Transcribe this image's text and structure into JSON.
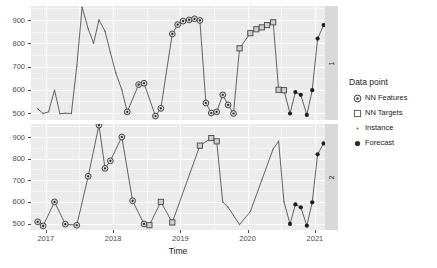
{
  "chart_data": {
    "type": "line",
    "title": "",
    "xlabel": "Time",
    "ylabel": "",
    "xlim": [
      2016.78,
      2021.15
    ],
    "ylim": [
      470,
      960
    ],
    "grid": true,
    "legend_position": "right",
    "x_ticks": [
      "2017",
      "2018",
      "2019",
      "2020",
      "2021"
    ],
    "x_tick_values": [
      2017,
      2018,
      2019,
      2020,
      2021
    ],
    "y_ticks": [
      "500",
      "600",
      "700",
      "800",
      "900"
    ],
    "y_tick_values": [
      500,
      600,
      700,
      800,
      900
    ],
    "facets": [
      {
        "strip_label": "1"
      },
      {
        "strip_label": "2"
      }
    ],
    "legend": {
      "title": "Data point",
      "items": [
        {
          "label": "NN Features",
          "marker": "circle-dot"
        },
        {
          "label": "NN Targets",
          "marker": "open-square"
        },
        {
          "label": "Instance",
          "marker": "small-dot"
        },
        {
          "label": "Forecast",
          "marker": "filled-circle"
        }
      ]
    },
    "panels": [
      {
        "id": "1",
        "strip_label": "1",
        "series": [
          {
            "name": "panel1-line",
            "marker_groups": [
              {
                "type": "instance",
                "points": [
                  [
                    2016.88,
                    518
                  ],
                  [
                    2016.96,
                    498
                  ],
                  [
                    2017.04,
                    505
                  ],
                  [
                    2017.13,
                    598
                  ],
                  [
                    2017.21,
                    497
                  ],
                  [
                    2017.29,
                    499
                  ],
                  [
                    2017.38,
                    498
                  ],
                  [
                    2017.46,
                    700
                  ],
                  [
                    2017.54,
                    955
                  ],
                  [
                    2017.63,
                    862
                  ],
                  [
                    2017.71,
                    800
                  ],
                  [
                    2017.79,
                    900
                  ],
                  [
                    2017.88,
                    852
                  ],
                  [
                    2017.96,
                    760
                  ],
                  [
                    2018.04,
                    672
                  ],
                  [
                    2018.13,
                    600
                  ]
                ]
              },
              {
                "type": "nn-features",
                "points": [
                  [
                    2018.21,
                    505
                  ],
                  [
                    2018.38,
                    622
                  ],
                  [
                    2018.46,
                    628
                  ],
                  [
                    2018.63,
                    487
                  ],
                  [
                    2018.71,
                    520
                  ],
                  [
                    2018.88,
                    840
                  ],
                  [
                    2018.96,
                    880
                  ],
                  [
                    2019.04,
                    895
                  ],
                  [
                    2019.13,
                    900
                  ],
                  [
                    2019.21,
                    905
                  ],
                  [
                    2019.29,
                    898
                  ],
                  [
                    2019.38,
                    543
                  ],
                  [
                    2019.46,
                    500
                  ],
                  [
                    2019.54,
                    505
                  ],
                  [
                    2019.63,
                    578
                  ],
                  [
                    2019.71,
                    535
                  ],
                  [
                    2019.79,
                    498
                  ]
                ]
              },
              {
                "type": "nn-targets",
                "points": [
                  [
                    2019.88,
                    778
                  ],
                  [
                    2020.04,
                    843
                  ],
                  [
                    2020.13,
                    860
                  ],
                  [
                    2020.21,
                    868
                  ],
                  [
                    2020.29,
                    878
                  ],
                  [
                    2020.38,
                    890
                  ],
                  [
                    2020.46,
                    600
                  ],
                  [
                    2020.54,
                    598
                  ]
                ]
              },
              {
                "type": "forecast",
                "points": [
                  [
                    2020.63,
                    498
                  ],
                  [
                    2020.71,
                    590
                  ],
                  [
                    2020.79,
                    578
                  ],
                  [
                    2020.88,
                    492
                  ],
                  [
                    2020.96,
                    598
                  ],
                  [
                    2021.04,
                    820
                  ],
                  [
                    2021.13,
                    878
                  ],
                  [
                    2021.21,
                    888
                  ],
                  [
                    2021.29,
                    890
                  ],
                  [
                    2021.38,
                    600
                  ],
                  [
                    2021.46,
                    548
                  ]
                ]
              }
            ]
          }
        ]
      },
      {
        "id": "2",
        "strip_label": "2",
        "series": [
          {
            "name": "panel2-line",
            "marker_groups": [
              {
                "type": "nn-features",
                "points": [
                  [
                    2016.88,
                    508
                  ],
                  [
                    2016.96,
                    489
                  ],
                  [
                    2017.13,
                    600
                  ],
                  [
                    2017.29,
                    497
                  ],
                  [
                    2017.46,
                    492
                  ],
                  [
                    2017.63,
                    718
                  ],
                  [
                    2017.79,
                    955
                  ],
                  [
                    2017.88,
                    755
                  ],
                  [
                    2017.96,
                    790
                  ],
                  [
                    2018.13,
                    900
                  ],
                  [
                    2018.29,
                    605
                  ],
                  [
                    2018.46,
                    498
                  ]
                ]
              },
              {
                "type": "nn-targets",
                "points": [
                  [
                    2018.54,
                    492
                  ],
                  [
                    2018.71,
                    600
                  ],
                  [
                    2018.88,
                    505
                  ],
                  [
                    2019.29,
                    860
                  ],
                  [
                    2019.46,
                    895
                  ],
                  [
                    2019.54,
                    880
                  ]
                ]
              },
              {
                "type": "instance",
                "points": [
                  [
                    2019.63,
                    600
                  ],
                  [
                    2019.71,
                    575
                  ],
                  [
                    2019.88,
                    495
                  ],
                  [
                    2020.04,
                    555
                  ],
                  [
                    2020.21,
                    700
                  ],
                  [
                    2020.38,
                    845
                  ],
                  [
                    2020.46,
                    880
                  ],
                  [
                    2020.54,
                    600
                  ]
                ]
              },
              {
                "type": "forecast",
                "points": [
                  [
                    2020.63,
                    498
                  ],
                  [
                    2020.71,
                    588
                  ],
                  [
                    2020.79,
                    575
                  ],
                  [
                    2020.88,
                    490
                  ],
                  [
                    2020.96,
                    598
                  ],
                  [
                    2021.04,
                    820
                  ],
                  [
                    2021.13,
                    870
                  ],
                  [
                    2021.21,
                    885
                  ],
                  [
                    2021.29,
                    890
                  ],
                  [
                    2021.38,
                    600
                  ],
                  [
                    2021.46,
                    548
                  ]
                ]
              }
            ]
          }
        ]
      }
    ]
  }
}
